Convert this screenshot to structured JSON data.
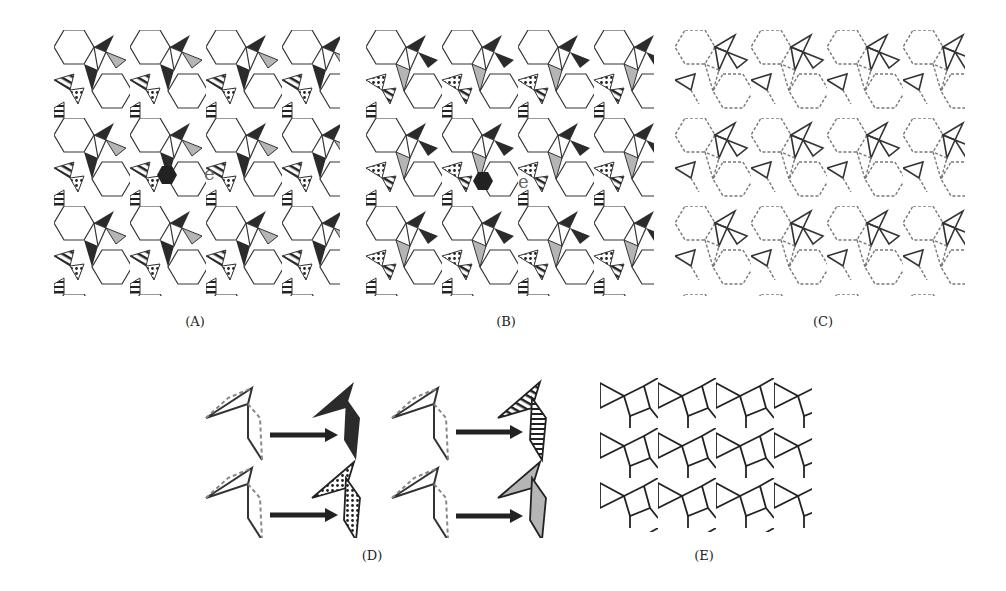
{
  "figure": {
    "panels": [
      {
        "id": "A",
        "label": "(A)",
        "description": "Filled tiling pattern with black, gray, hatched and dotted rhombi",
        "annotation": "e",
        "marker": "hexagon"
      },
      {
        "id": "B",
        "label": "(B)",
        "description": "Alternate filled tiling pattern",
        "annotation": "e",
        "marker": "hexagon"
      },
      {
        "id": "C",
        "label": "(C)",
        "description": "Line tiling with solid and dashed edges"
      },
      {
        "id": "D",
        "label": "(D)",
        "description": "Rhombus-pair to filled motif mapping, four arrow transitions",
        "fills": [
          "black",
          "dotted",
          "hatched",
          "gray"
        ]
      },
      {
        "id": "E",
        "label": "(E)",
        "description": "Solid line tiling of triangles and quadrilaterals"
      }
    ],
    "colors": {
      "dark": "#2b2b2b",
      "gray": "#b5b5b5",
      "line": "#333333",
      "dash": "#777777"
    }
  }
}
